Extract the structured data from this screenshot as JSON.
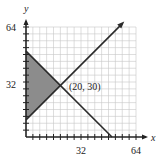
{
  "chart_data": {
    "type": "line",
    "title": "",
    "xlabel": "x",
    "ylabel": "y",
    "xlim": [
      0,
      64
    ],
    "ylim": [
      0,
      64
    ],
    "x_ticks": [
      32,
      64
    ],
    "y_ticks": [
      32,
      64
    ],
    "minor_tick_step": 4,
    "grid": true,
    "series": [
      {
        "name": "descending-line",
        "points": [
          [
            0,
            50
          ],
          [
            50,
            0
          ]
        ]
      },
      {
        "name": "ascending-line",
        "points": [
          [
            0,
            10
          ],
          [
            56,
            66
          ]
        ],
        "arrow": true
      }
    ],
    "shaded_region": {
      "vertices": [
        [
          0,
          10
        ],
        [
          20,
          30
        ],
        [
          0,
          50
        ]
      ],
      "color": "#8c8c8c"
    },
    "annotations": [
      {
        "text": "(20, 30)",
        "x": 20,
        "y": 30
      }
    ]
  },
  "labels": {
    "x_axis": "x",
    "y_axis": "y",
    "x_tick_32": "32",
    "x_tick_64": "64",
    "y_tick_32": "32",
    "y_tick_64": "64",
    "intersection": "(20, 30)"
  },
  "colors": {
    "grid": "#c8c8c8",
    "axis": "#222222",
    "line": "#2a2a2a",
    "shade": "#8c8c8c"
  }
}
